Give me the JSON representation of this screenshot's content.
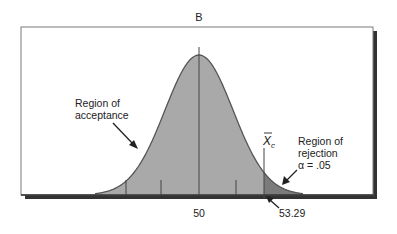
{
  "chart_data": {
    "type": "area",
    "title": "B",
    "xlabel": "",
    "ylabel": "",
    "distribution": "normal",
    "mean": 50,
    "critical_value": 53.29,
    "alpha": 0.05,
    "x_tick_labels": [
      "50",
      "53.29"
    ],
    "regions": [
      {
        "name": "Region of acceptance",
        "label_lines": [
          "Region of",
          "acceptance"
        ],
        "color": "#a9a9a9"
      },
      {
        "name": "Region of rejection",
        "label_lines": [
          "Region of",
          "rejection",
          "α = .05"
        ],
        "color": "#7b7b7b"
      }
    ],
    "critical_label": "X̄c",
    "grid": false,
    "legend": "none"
  },
  "figure": {
    "title": "B",
    "acceptance_label": {
      "line1": "Region of",
      "line2": "acceptance"
    },
    "rejection_label": {
      "line1": "Region of",
      "line2": "rejection",
      "line3": "α = .05"
    },
    "critical_symbol": "X",
    "critical_subscript": "c",
    "mean_label": "50",
    "critical_value_label": "53.29",
    "colors": {
      "acceptance_fill": "#a9a9a9",
      "rejection_fill": "#7b7b7b",
      "curve_stroke": "#555555",
      "frame_border": "#7a7a7a",
      "frame_shadow": "#333333",
      "text": "#222222"
    }
  }
}
